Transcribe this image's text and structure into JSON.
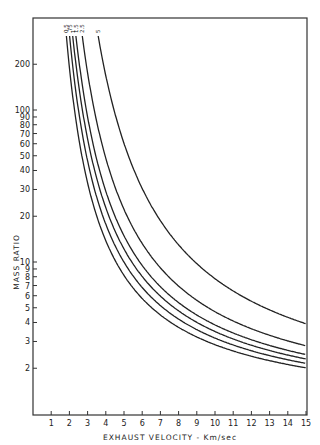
{
  "chart_data": {
    "type": "line",
    "title": "",
    "xlabel": "EXHAUST VELOCITY - Km/sec",
    "ylabel": "MASS RATIO",
    "xlim": [
      0,
      15
    ],
    "ylim": [
      1,
      400
    ],
    "yscale": "log",
    "grid": false,
    "legend": "curve labels at top of each curve (rotated)",
    "x_ticks": [
      1,
      2,
      3,
      4,
      5,
      6,
      7,
      8,
      9,
      10,
      11,
      12,
      13,
      14,
      15
    ],
    "y_ticks": [
      2,
      3,
      4,
      5,
      6,
      7,
      8,
      9,
      10,
      20,
      30,
      40,
      50,
      60,
      70,
      80,
      90,
      100,
      200
    ],
    "series": [
      {
        "name": "0.5",
        "delta_v": 10.5,
        "x": [
          2.1,
          3,
          4,
          5,
          6,
          8,
          10,
          12,
          15
        ],
        "values": [
          148,
          33,
          13.8,
          8.2,
          5.8,
          3.7,
          2.86,
          2.4,
          2.01
        ]
      },
      {
        "name": ".75",
        "delta_v": 11.5,
        "x": [
          2.3,
          3,
          4,
          5,
          6,
          8,
          10,
          12,
          15
        ],
        "values": [
          148,
          46,
          17.8,
          10,
          6.8,
          4.2,
          3.16,
          2.61,
          2.15
        ]
      },
      {
        "name": "1",
        "delta_v": 12.5,
        "x": [
          2.5,
          3,
          4,
          5,
          6,
          8,
          10,
          12,
          15
        ],
        "values": [
          148,
          64,
          22.8,
          12.2,
          8.1,
          4.77,
          3.49,
          2.83,
          2.3
        ]
      },
      {
        "name": "1.5",
        "delta_v": 13.5,
        "x": [
          2.7,
          3,
          4,
          5,
          6,
          8,
          10,
          12,
          15
        ],
        "values": [
          148,
          90,
          29.2,
          14.9,
          9.5,
          5.4,
          3.86,
          3.08,
          2.46
        ]
      },
      {
        "name": "2.5",
        "delta_v": 15.5,
        "x": [
          3.1,
          4,
          5,
          6,
          8,
          10,
          12,
          15
        ],
        "values": [
          148,
          48,
          22.2,
          13.2,
          6.9,
          4.71,
          3.64,
          2.81
        ]
      },
      {
        "name": "5",
        "delta_v": 20.5,
        "x": [
          4.1,
          5,
          6,
          8,
          10,
          12,
          15
        ],
        "values": [
          148,
          60,
          30.5,
          13.0,
          7.77,
          5.52,
          3.92
        ]
      }
    ],
    "formula": "mass_ratio = exp(delta_v / exhaust_velocity)"
  },
  "labels": {
    "x_axis": "EXHAUST VELOCITY - Km/sec",
    "y_axis": "MASS RATIO"
  }
}
